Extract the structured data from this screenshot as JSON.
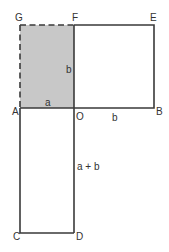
{
  "diagram": {
    "title": "",
    "colors": {
      "stroke": "#3a3a3a",
      "shaded_fill": "#c8c8c8",
      "label": "#333333",
      "background": "#ffffff"
    },
    "points": {
      "G": {
        "label": "G",
        "x": 20,
        "y": 25
      },
      "F": {
        "label": "F",
        "x": 74,
        "y": 25
      },
      "E": {
        "label": "E",
        "x": 154,
        "y": 25
      },
      "A": {
        "label": "A",
        "x": 20,
        "y": 108
      },
      "O": {
        "label": "O",
        "x": 74,
        "y": 108
      },
      "B": {
        "label": "B",
        "x": 154,
        "y": 108
      },
      "C": {
        "label": "C",
        "x": 20,
        "y": 233
      },
      "D": {
        "label": "D",
        "x": 74,
        "y": 233
      }
    },
    "shapes": [
      {
        "name": "shaded-rectangle-AOFG",
        "vertices": [
          "A",
          "O",
          "F",
          "G"
        ],
        "shaded": true,
        "dashed_edges": [
          "A-G",
          "G-F"
        ]
      },
      {
        "name": "square-OBEF",
        "vertices": [
          "O",
          "B",
          "E",
          "F"
        ],
        "shaded": false
      },
      {
        "name": "rectangle-ACDO",
        "vertices": [
          "A",
          "C",
          "D",
          "O"
        ],
        "shaded": false
      }
    ],
    "segment_labels": {
      "AO": "a",
      "OF": "b",
      "OB": "b",
      "OD": "a + b"
    }
  }
}
